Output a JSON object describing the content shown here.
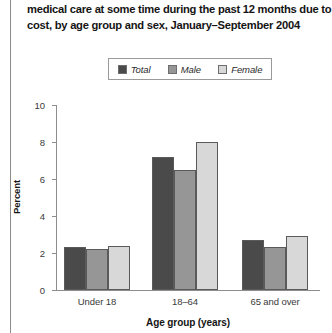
{
  "caption": {
    "line1": "medical care at some time during the past 12 months due to",
    "line2": "cost, by age group and sex, January–September 2004"
  },
  "chart_data": {
    "type": "bar",
    "title": "medical care at some time during the past 12 months due to cost, by age group and sex, January–September 2004",
    "xlabel": "Age group (years)",
    "ylabel": "Percent",
    "categories": [
      "Under 18",
      "18–64",
      "65 and over"
    ],
    "series": [
      {
        "name": "Total",
        "values": [
          2.3,
          7.2,
          2.7
        ],
        "color": "#4a4a4a"
      },
      {
        "name": "Male",
        "values": [
          2.2,
          6.5,
          2.3
        ],
        "color": "#969696"
      },
      {
        "name": "Female",
        "values": [
          2.4,
          8.0,
          2.9
        ],
        "color": "#d8d8d8"
      }
    ],
    "ylim": [
      0,
      10
    ],
    "yticks": [
      "0",
      "2",
      "4",
      "6",
      "8",
      "10"
    ],
    "grid": false,
    "legend_position": "top-center"
  },
  "legend": {
    "items": [
      {
        "label": "Total",
        "color": "#4a4a4a"
      },
      {
        "label": "Male",
        "color": "#969696"
      },
      {
        "label": "Female",
        "color": "#d8d8d8"
      }
    ]
  },
  "axis": {
    "ticks": [
      "10",
      "8",
      "6",
      "4",
      "2",
      "0"
    ],
    "ylabel": "Percent",
    "xlabel": "Age group (years)",
    "categories": [
      "Under 18",
      "18–64",
      "65 and over"
    ]
  }
}
